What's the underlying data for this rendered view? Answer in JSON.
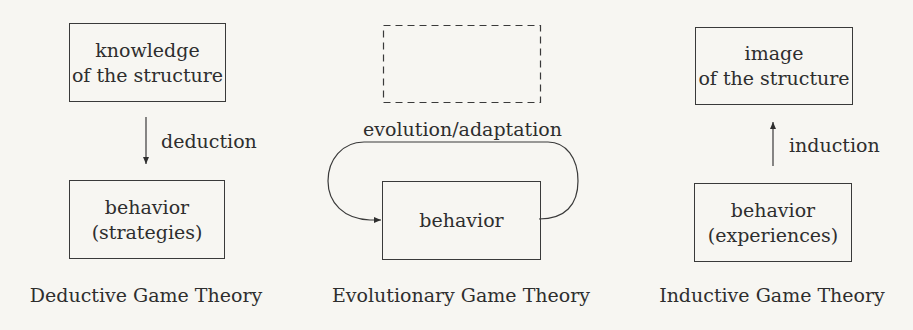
{
  "panels": [
    {
      "id": "deductive",
      "caption": "Deductive Game Theory",
      "top_box": {
        "lines": [
          "knowledge",
          "of the structure"
        ],
        "style": "solid"
      },
      "bottom_box": {
        "lines": [
          "behavior",
          "(strategies)"
        ],
        "style": "solid"
      },
      "arrow": {
        "direction": "down",
        "label": "deduction"
      }
    },
    {
      "id": "evolutionary",
      "caption": "Evolutionary Game Theory",
      "top_box": {
        "lines": [],
        "style": "dashed"
      },
      "bottom_box": {
        "lines": [
          "behavior"
        ],
        "style": "solid"
      },
      "loop": {
        "label": "evolution/adaptation"
      }
    },
    {
      "id": "inductive",
      "caption": "Inductive Game Theory",
      "top_box": {
        "lines": [
          "image",
          "of the structure"
        ],
        "style": "solid"
      },
      "bottom_box": {
        "lines": [
          "behavior",
          "(experiences)"
        ],
        "style": "solid"
      },
      "arrow": {
        "direction": "up",
        "label": "induction"
      }
    }
  ],
  "colors": {
    "background": "#f7f6f2",
    "ink": "#2e2e2e"
  }
}
